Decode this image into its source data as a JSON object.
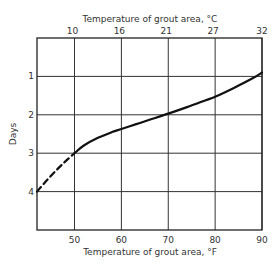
{
  "chart_data": {
    "type": "line",
    "title": "",
    "xlabel": "Temperature of grout area, °F",
    "x2label": "Temperature of grout area, °C",
    "ylabel": "Days",
    "xlim": [
      42,
      90
    ],
    "ylim": [
      0,
      5
    ],
    "y_inverted": true,
    "grid": true,
    "x_ticks": [
      50,
      60,
      70,
      80,
      90
    ],
    "x_tick_labels": [
      "50",
      "60",
      "70",
      "80",
      "90"
    ],
    "x2_ticks_at_F": [
      50,
      60,
      70,
      80,
      90
    ],
    "x2_tick_labels": [
      "10",
      "16",
      "21",
      "27",
      "32"
    ],
    "y_ticks": [
      1,
      2,
      3,
      4
    ],
    "y_tick_labels": [
      "1",
      "2",
      "3",
      "4"
    ],
    "series": [
      {
        "name": "extrapolated",
        "style": "dashed",
        "x": [
          42,
          44,
          46,
          48,
          50
        ],
        "y": [
          4.0,
          3.72,
          3.46,
          3.22,
          3.0
        ]
      },
      {
        "name": "measured",
        "style": "solid",
        "x": [
          50,
          52,
          55,
          58,
          60,
          63,
          66,
          70,
          74,
          78,
          80,
          84,
          88,
          90
        ],
        "y": [
          3.0,
          2.8,
          2.6,
          2.45,
          2.37,
          2.25,
          2.13,
          1.97,
          1.8,
          1.62,
          1.53,
          1.3,
          1.05,
          0.9
        ]
      }
    ]
  }
}
